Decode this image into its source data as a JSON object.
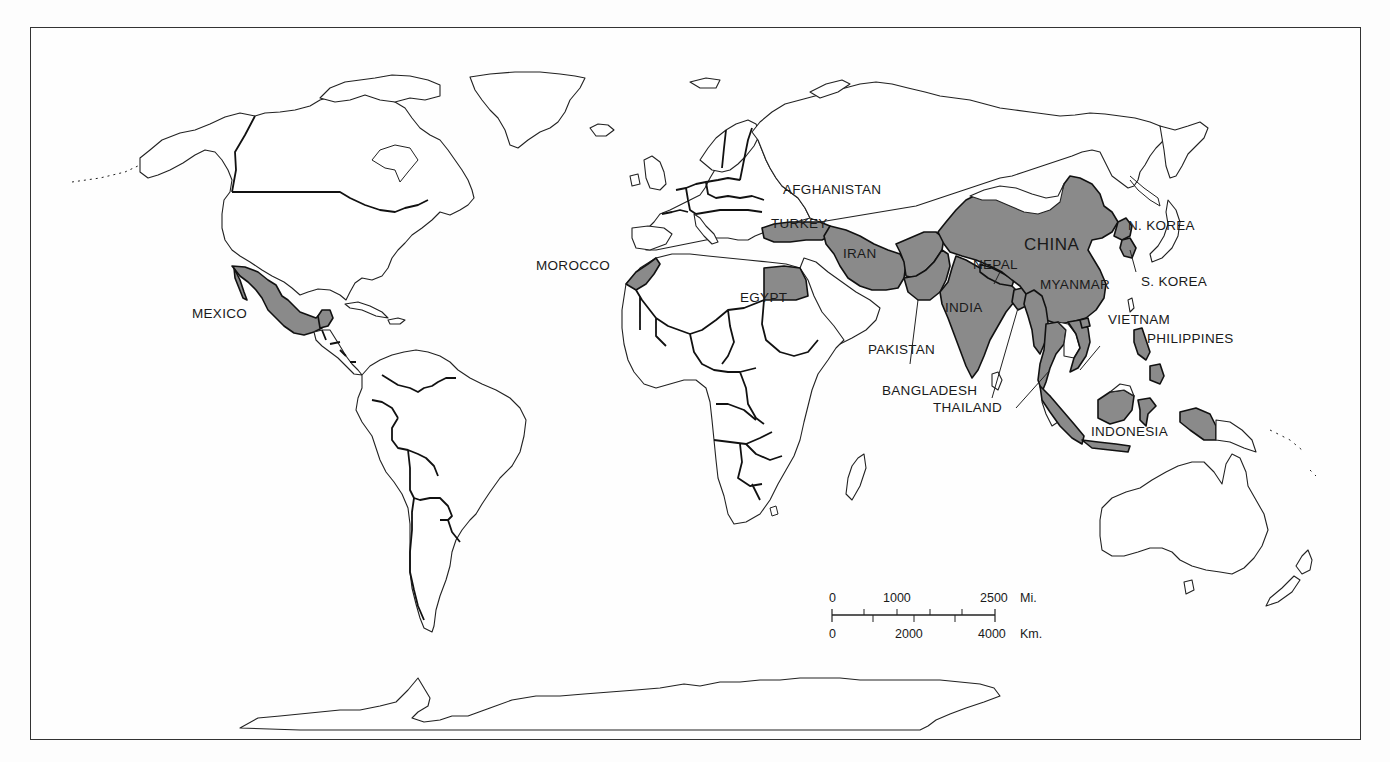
{
  "map": {
    "type": "world political outline map",
    "projection_style": "equirectangular-like",
    "frame": {
      "left": 30,
      "top": 27,
      "right": 1361,
      "bottom": 740
    },
    "colors": {
      "highlight_fill": "#8a8a8a",
      "land_fill": "#ffffff",
      "outline": "#222222",
      "background": "#fdfdfd"
    },
    "highlighted_countries": [
      "Mexico",
      "Morocco",
      "Egypt",
      "Turkey",
      "Iran",
      "Afghanistan",
      "Pakistan",
      "India",
      "Nepal",
      "Bangladesh",
      "China",
      "N. Korea",
      "S. Korea",
      "Myanmar",
      "Thailand",
      "Vietnam",
      "Philippines",
      "Indonesia"
    ]
  },
  "labels": {
    "mexico": "MEXICO",
    "morocco": "MOROCCO",
    "egypt": "EGYPT",
    "turkey": "TURKEY",
    "afghanistan": "AFGHANISTAN",
    "iran": "IRAN",
    "pakistan": "PAKISTAN",
    "india": "INDIA",
    "nepal": "NEPAL",
    "bangladesh": "BANGLADESH",
    "thailand": "THAILAND",
    "china": "CHINA",
    "n_korea": "N. KOREA",
    "s_korea": "S. KOREA",
    "myanmar": "MYANMAR",
    "vietnam": "VIETNAM",
    "philippines": "PHILIPPINES",
    "indonesia": "INDONESIA"
  },
  "scale_bar": {
    "miles": {
      "ticks": [
        "0",
        "1000",
        "2500"
      ],
      "unit": "Mi."
    },
    "km": {
      "ticks": [
        "0",
        "2000",
        "4000"
      ],
      "unit": "Km."
    }
  }
}
